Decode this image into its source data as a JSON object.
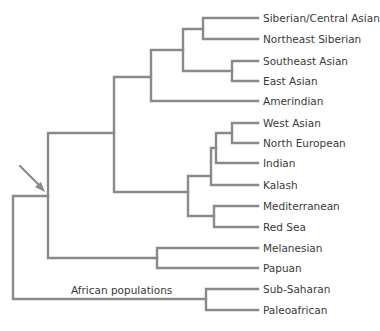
{
  "tree": {
    "leaves": [
      {
        "label": "Siberian/Central Asian",
        "y": 18
      },
      {
        "label": "Northeast Siberian",
        "y": 39
      },
      {
        "label": "Southeast Asian",
        "y": 61
      },
      {
        "label": "East Asian",
        "y": 81
      },
      {
        "label": "Amerindian",
        "y": 101
      },
      {
        "label": "West Asian",
        "y": 123
      },
      {
        "label": "North European",
        "y": 143
      },
      {
        "label": "Indian",
        "y": 163
      },
      {
        "label": "Kalash",
        "y": 185
      },
      {
        "label": "Mediterranean",
        "y": 206
      },
      {
        "label": "Red Sea",
        "y": 227
      },
      {
        "label": "Melanesian",
        "y": 248
      },
      {
        "label": "Papuan",
        "y": 268
      },
      {
        "label": "Sub-Saharan",
        "y": 289
      },
      {
        "label": "Paleoafrican",
        "y": 310
      }
    ],
    "group_label": "African populations",
    "colors": {
      "branch": "#8a8a8a",
      "arrow": "#8a8a8a",
      "text": "#3a3a3a"
    }
  }
}
